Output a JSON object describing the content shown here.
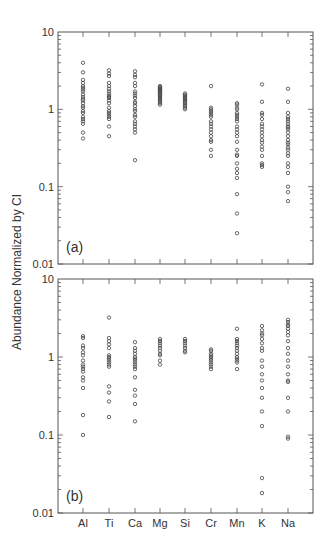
{
  "chart_data": [
    {
      "type": "scatter",
      "panel_label": "(a)",
      "ylabel": "Abundance Normalized by CI",
      "yscale": "log",
      "ylim": [
        0.01,
        10
      ],
      "ytick_labels": [
        "10",
        "1",
        "0.1",
        "0.01"
      ],
      "categories": [
        "Al",
        "Ti",
        "Ca",
        "Mg",
        "Si",
        "Cr",
        "Mn",
        "K",
        "Na"
      ],
      "series": [
        {
          "name": "Al",
          "values": [
            4.0,
            3.0,
            2.4,
            2.2,
            2.0,
            1.9,
            1.8,
            1.7,
            1.55,
            1.45,
            1.35,
            1.3,
            1.2,
            1.1,
            1.05,
            0.95,
            0.9,
            0.8,
            0.75,
            0.7,
            0.65,
            0.5,
            0.42
          ]
        },
        {
          "name": "Ti",
          "values": [
            3.2,
            2.9,
            2.7,
            2.2,
            2.0,
            1.85,
            1.7,
            1.6,
            1.5,
            1.45,
            1.4,
            1.3,
            1.2,
            1.05,
            0.95,
            0.9,
            0.85,
            0.8,
            0.75,
            0.6,
            0.45
          ]
        },
        {
          "name": "Ca",
          "values": [
            3.1,
            2.8,
            2.6,
            2.2,
            2.0,
            1.7,
            1.6,
            1.5,
            1.4,
            1.25,
            1.2,
            1.1,
            1.0,
            0.95,
            0.85,
            0.8,
            0.7,
            0.65,
            0.6,
            0.55,
            0.5,
            0.22
          ]
        },
        {
          "name": "Mg",
          "values": [
            2.0,
            1.95,
            1.9,
            1.85,
            1.8,
            1.75,
            1.7,
            1.65,
            1.6,
            1.55,
            1.5,
            1.45,
            1.4,
            1.35,
            1.3,
            1.25,
            1.2,
            1.15
          ]
        },
        {
          "name": "Si",
          "values": [
            1.6,
            1.55,
            1.5,
            1.45,
            1.4,
            1.35,
            1.3,
            1.25,
            1.2,
            1.15,
            1.1,
            1.05,
            1.0
          ]
        },
        {
          "name": "Cr",
          "values": [
            2.0,
            1.05,
            1.0,
            0.95,
            0.9,
            0.85,
            0.8,
            0.7,
            0.65,
            0.6,
            0.55,
            0.5,
            0.45,
            0.4,
            0.38,
            0.3,
            0.25
          ]
        },
        {
          "name": "Mn",
          "values": [
            1.2,
            1.15,
            1.05,
            1.0,
            0.9,
            0.85,
            0.8,
            0.75,
            0.7,
            0.6,
            0.55,
            0.5,
            0.45,
            0.38,
            0.3,
            0.26,
            0.25,
            0.2,
            0.17,
            0.15,
            0.13,
            0.08,
            0.045,
            0.025
          ]
        },
        {
          "name": "K",
          "values": [
            2.1,
            1.25,
            0.9,
            0.85,
            0.75,
            0.65,
            0.6,
            0.55,
            0.5,
            0.45,
            0.4,
            0.37,
            0.33,
            0.3,
            0.25,
            0.2,
            0.19,
            0.18
          ]
        },
        {
          "name": "Na",
          "values": [
            1.85,
            1.25,
            0.9,
            0.8,
            0.75,
            0.7,
            0.65,
            0.6,
            0.58,
            0.55,
            0.5,
            0.45,
            0.4,
            0.37,
            0.35,
            0.32,
            0.3,
            0.27,
            0.25,
            0.2,
            0.18,
            0.15,
            0.1,
            0.085,
            0.065
          ]
        }
      ]
    },
    {
      "type": "scatter",
      "panel_label": "(b)",
      "ylabel": "Abundance Normalized by CI",
      "yscale": "log",
      "ylim": [
        0.01,
        10
      ],
      "ytick_labels": [
        "10",
        "1",
        "0.1",
        "0.01"
      ],
      "categories": [
        "Al",
        "Ti",
        "Ca",
        "Mg",
        "Si",
        "Cr",
        "Mn",
        "K",
        "Na"
      ],
      "series": [
        {
          "name": "Al",
          "values": [
            1.85,
            1.75,
            1.4,
            1.3,
            1.15,
            1.05,
            0.9,
            0.8,
            0.75,
            0.7,
            0.65,
            0.55,
            0.5,
            0.4,
            0.18,
            0.1
          ]
        },
        {
          "name": "Ti",
          "values": [
            3.2,
            1.75,
            1.6,
            1.45,
            1.3,
            1.05,
            1.0,
            0.95,
            0.9,
            0.85,
            0.8,
            0.75,
            0.42,
            0.35,
            0.27,
            0.17
          ]
        },
        {
          "name": "Ca",
          "values": [
            1.55,
            1.3,
            1.2,
            1.1,
            1.0,
            0.95,
            0.9,
            0.85,
            0.8,
            0.75,
            0.7,
            0.55,
            0.38,
            0.32,
            0.25,
            0.15
          ]
        },
        {
          "name": "Mg",
          "values": [
            1.7,
            1.6,
            1.5,
            1.4,
            1.3,
            1.2,
            1.1,
            1.05,
            0.9,
            0.8
          ]
        },
        {
          "name": "Si",
          "values": [
            1.7,
            1.6,
            1.5,
            1.4,
            1.3,
            1.2,
            1.15
          ]
        },
        {
          "name": "Cr",
          "values": [
            1.25,
            1.2,
            1.1,
            1.05,
            1.0,
            0.95,
            0.9,
            0.85,
            0.8,
            0.75,
            0.7
          ]
        },
        {
          "name": "Mn",
          "values": [
            2.3,
            1.7,
            1.6,
            1.5,
            1.4,
            1.3,
            1.2,
            1.1,
            1.0,
            0.95,
            0.9,
            0.85,
            0.7
          ]
        },
        {
          "name": "K",
          "values": [
            2.5,
            2.2,
            2.0,
            1.9,
            1.7,
            1.5,
            1.3,
            1.2,
            0.9,
            0.75,
            0.6,
            0.5,
            0.4,
            0.3,
            0.2,
            0.13,
            0.028,
            0.018
          ]
        },
        {
          "name": "Na",
          "values": [
            3.0,
            2.8,
            2.6,
            2.5,
            2.3,
            2.1,
            1.9,
            1.6,
            1.3,
            1.1,
            0.9,
            0.75,
            0.6,
            0.5,
            0.48,
            0.3,
            0.2,
            0.095,
            0.09
          ]
        }
      ]
    }
  ],
  "axis": {
    "ylabel": "Abundance Normalized by CI",
    "ytick_labels": [
      "10",
      "1",
      "0.1",
      "0.01"
    ],
    "xtick_labels": [
      "Al",
      "Ti",
      "Ca",
      "Mg",
      "Si",
      "Cr",
      "Mn",
      "K",
      "Na"
    ]
  },
  "panels": [
    {
      "label": "(a)"
    },
    {
      "label": "(b)"
    }
  ],
  "colors": {
    "frame": "#555555",
    "marker_stroke": "#444444",
    "text": "#333333"
  }
}
